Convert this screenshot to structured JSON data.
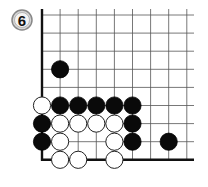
{
  "problem": {
    "number": "6",
    "badge_color": "#d8d8d8",
    "badge_border": "#777777"
  },
  "board": {
    "cols": 9,
    "rows": 9,
    "open_edges": [
      "top",
      "right"
    ],
    "line_color": "#555555",
    "edge_color": "#111111",
    "stones": [
      {
        "color": "black",
        "col": 1,
        "row": 3
      },
      {
        "color": "white",
        "col": 0,
        "row": 5
      },
      {
        "color": "black",
        "col": 1,
        "row": 5
      },
      {
        "color": "black",
        "col": 2,
        "row": 5
      },
      {
        "color": "black",
        "col": 3,
        "row": 5
      },
      {
        "color": "black",
        "col": 4,
        "row": 5
      },
      {
        "color": "black",
        "col": 5,
        "row": 5
      },
      {
        "color": "black",
        "col": 0,
        "row": 6
      },
      {
        "color": "white",
        "col": 1,
        "row": 6
      },
      {
        "color": "white",
        "col": 2,
        "row": 6
      },
      {
        "color": "white",
        "col": 3,
        "row": 6
      },
      {
        "color": "white",
        "col": 4,
        "row": 6
      },
      {
        "color": "black",
        "col": 5,
        "row": 6
      },
      {
        "color": "black",
        "col": 0,
        "row": 7
      },
      {
        "color": "white",
        "col": 1,
        "row": 7
      },
      {
        "color": "white",
        "col": 4,
        "row": 7
      },
      {
        "color": "black",
        "col": 5,
        "row": 7
      },
      {
        "color": "black",
        "col": 7,
        "row": 7
      },
      {
        "color": "white",
        "col": 1,
        "row": 8
      },
      {
        "color": "white",
        "col": 2,
        "row": 8
      },
      {
        "color": "white",
        "col": 4,
        "row": 8
      }
    ]
  }
}
